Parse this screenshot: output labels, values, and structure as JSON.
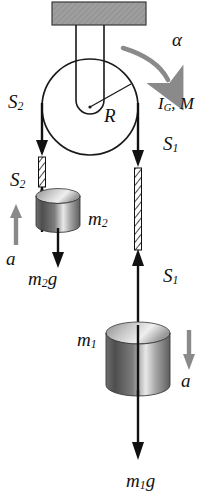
{
  "figure": {
    "type": "physics-free-body-diagram",
    "colors": {
      "ink": "#111111",
      "ceiling_fill": "#9b9b9b",
      "accel_arrow": "#8a8a8a",
      "alpha_arrow": "#8a8a8a",
      "cylinder_dark": "#4a4a4a",
      "cylinder_light": "#f2f2f2"
    }
  },
  "labels": {
    "alpha": "α",
    "radius": "R",
    "inertia_mass": {
      "main": "I",
      "sub": "G",
      "rest": ", M"
    },
    "tension_left_top": {
      "main": "S",
      "sub": "2"
    },
    "tension_left_bottom": {
      "main": "S",
      "sub": "2"
    },
    "tension_right_top": {
      "main": "S",
      "sub": "1"
    },
    "tension_right_bottom": {
      "main": "S",
      "sub": "1"
    },
    "mass_left": {
      "main": "m",
      "sub": "2"
    },
    "mass_right": {
      "main": "m",
      "sub": "1"
    },
    "weight_left": {
      "main": "m",
      "sub": "2",
      "rest": "g"
    },
    "weight_right": {
      "main": "m",
      "sub": "1",
      "rest": "g"
    },
    "accel_left": "a",
    "accel_right": "a"
  },
  "elements": {
    "ceiling": "hatched-support-block",
    "pulley": "pulley-disc",
    "bracket": "pulley-hanger-bracket",
    "rope_left": "rope-left-hatched",
    "rope_right": "rope-right-hatched",
    "cylinder_left": "mass-cylinder-m2",
    "cylinder_right": "mass-cylinder-m1"
  },
  "geometry": {
    "pulley_center": [
      90,
      107
    ],
    "pulley_radius": 48,
    "rope_left_x": 42,
    "rope_right_x": 138
  }
}
